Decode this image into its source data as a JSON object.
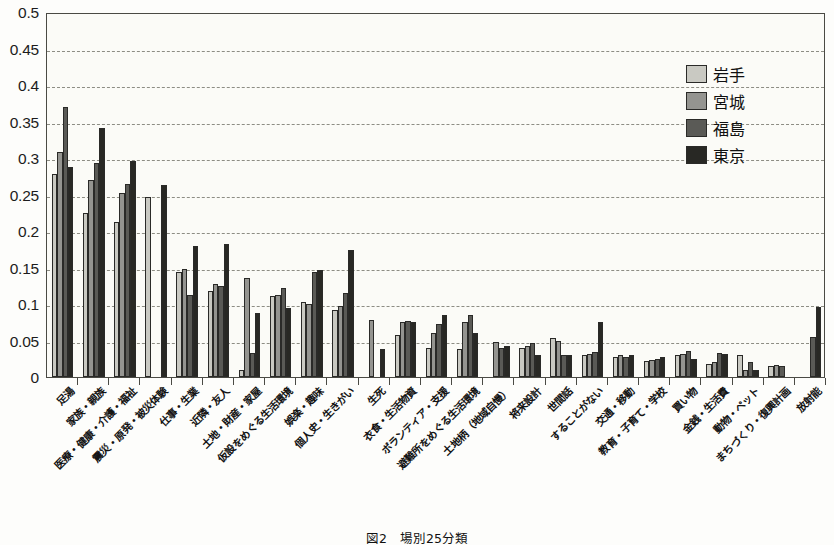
{
  "chart_data": {
    "type": "bar",
    "title": "",
    "caption": "図2　場別25分類",
    "xlabel": "",
    "ylabel": "",
    "ylim": [
      0,
      0.5
    ],
    "ytick_labels": [
      "0.5",
      "0.45",
      "0.4",
      "0.35",
      "0.3",
      "0.25",
      "0.2",
      "0.15",
      "0.1",
      "0.05",
      "0"
    ],
    "ytick_values": [
      0.5,
      0.45,
      0.4,
      0.35,
      0.3,
      0.25,
      0.2,
      0.15,
      0.1,
      0.05,
      0
    ],
    "grid": "horizontal-dashed",
    "legend_position": "top-right",
    "categories": [
      "足湯",
      "家族・親族",
      "医療・健康・介護・福祉",
      "震災・原発・被災体験",
      "仕事・生業",
      "近隣・友人",
      "土地・財産・家屋",
      "仮設をめぐる生活環境",
      "娯楽・趣味",
      "個人史・生きがい",
      "生死",
      "衣食・生活物資",
      "ボランティア・支援",
      "避難所をめぐる生活環境",
      "土地柄（地域自慢）",
      "将来設計",
      "世間話",
      "することがない",
      "交通・移動",
      "教育・子育て・学校",
      "買い物",
      "金銭・生活費",
      "動物・ペット",
      "まちづくり・復興計画",
      "放射能"
    ],
    "series": [
      {
        "name": "岩手",
        "color": "#c9c9c2",
        "values": [
          0.278,
          0.225,
          0.213,
          0.247,
          0.144,
          0.118,
          0.01,
          0.111,
          0.103,
          0.092,
          0.0,
          0.058,
          0.04,
          0.038,
          0.0,
          0.04,
          0.053,
          0.03,
          0.028,
          0.022,
          0.03,
          0.018,
          0.03,
          0.015,
          0.0
        ]
      },
      {
        "name": "宮城",
        "color": "#949490",
        "values": [
          0.308,
          0.27,
          0.252,
          0.0,
          0.148,
          0.127,
          0.135,
          0.112,
          0.1,
          0.097,
          0.078,
          0.076,
          0.06,
          0.075,
          0.048,
          0.043,
          0.05,
          0.032,
          0.03,
          0.023,
          0.032,
          0.02,
          0.01,
          0.016,
          0.0
        ]
      },
      {
        "name": "福島",
        "color": "#5a5a56",
        "values": [
          0.37,
          0.293,
          0.264,
          0.0,
          0.113,
          0.124,
          0.033,
          0.122,
          0.144,
          0.115,
          0.0,
          0.077,
          0.073,
          0.085,
          0.04,
          0.047,
          0.03,
          0.034,
          0.028,
          0.025,
          0.035,
          0.033,
          0.02,
          0.015,
          0.055
        ]
      },
      {
        "name": "東京",
        "color": "#282824",
        "values": [
          0.288,
          0.341,
          0.296,
          0.263,
          0.18,
          0.182,
          0.088,
          0.095,
          0.146,
          0.174,
          0.038,
          0.076,
          0.085,
          0.06,
          0.042,
          0.03,
          0.03,
          0.075,
          0.03,
          0.028,
          0.025,
          0.032,
          0.01,
          0.0,
          0.096
        ]
      }
    ]
  }
}
